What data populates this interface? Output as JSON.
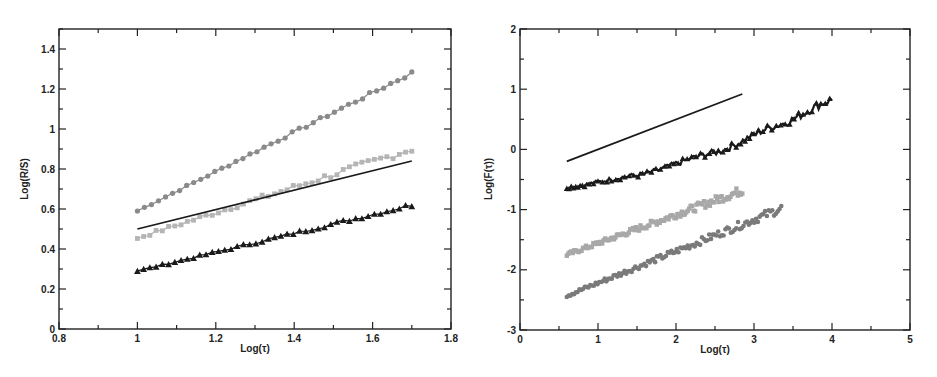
{
  "chart_data": [
    {
      "type": "line",
      "title": "",
      "xlabel": "Log(τ)",
      "ylabel": "Log(R/S)",
      "xlim": [
        0.8,
        1.8
      ],
      "ylim": [
        0,
        1.5
      ],
      "xticks": [
        0.8,
        1,
        1.2,
        1.4,
        1.6,
        1.8
      ],
      "xtick_labels": [
        "0.8",
        "1",
        "1.2",
        "1.4",
        "1.6",
        "1.8"
      ],
      "yticks": [
        0,
        0.2,
        0.4,
        0.6,
        0.8,
        1,
        1.2,
        1.4
      ],
      "ytick_labels": [
        "0",
        "0.2",
        "0.4",
        "0.6",
        "0.8",
        "1",
        "1.2",
        "1.4"
      ],
      "grid": false,
      "series": [
        {
          "name": "dark-gray-circles",
          "marker": "circle",
          "color": "#8a8a8a",
          "x": [
            1.0,
            1.7
          ],
          "y": [
            0.59,
            1.28
          ],
          "curve": "linear",
          "noise": 0.004
        },
        {
          "name": "light-gray-squares",
          "marker": "square",
          "color": "#b5b5b5",
          "x": [
            1.0,
            1.7
          ],
          "y": [
            0.455,
            0.9
          ],
          "curve": "linear",
          "noise": 0.008
        },
        {
          "name": "reference-line",
          "marker": "none",
          "color": "#1a1a1a",
          "x": [
            1.0,
            1.7
          ],
          "y": [
            0.5,
            0.84
          ]
        },
        {
          "name": "black-triangles",
          "marker": "triangle",
          "color": "#1a1a1a",
          "x": [
            1.0,
            1.7
          ],
          "y": [
            0.29,
            0.62
          ],
          "curve": "linear",
          "noise": 0.004
        }
      ]
    },
    {
      "type": "line",
      "title": "",
      "xlabel": "Log(τ)",
      "ylabel": "Log(F(τ))",
      "xlim": [
        0,
        5
      ],
      "ylim": [
        -3,
        2
      ],
      "xticks": [
        0,
        1,
        2,
        3,
        4,
        5
      ],
      "xtick_labels": [
        "0",
        "1",
        "2",
        "3",
        "4",
        "5"
      ],
      "yticks": [
        -3,
        -2,
        -1,
        0,
        1,
        2
      ],
      "ytick_labels": [
        "-3",
        "-2",
        "-1",
        "0",
        "1",
        "2"
      ],
      "grid": false,
      "series": [
        {
          "name": "reference-line",
          "marker": "none",
          "color": "#1a1a1a",
          "x": [
            0.6,
            2.85
          ],
          "y": [
            -0.2,
            0.92
          ]
        },
        {
          "name": "black-triangles",
          "marker": "triangle",
          "color": "#1a1a1a",
          "x": [
            0.6,
            1.5,
            2.5,
            3.3,
            4.0
          ],
          "y": [
            -0.63,
            -0.43,
            -0.05,
            0.4,
            0.82
          ],
          "curve": "smooth",
          "noise": 0.03
        },
        {
          "name": "light-gray-squares",
          "marker": "square",
          "color": "#a8a8a8",
          "x": [
            0.6,
            2.85
          ],
          "y": [
            -1.75,
            -0.68
          ],
          "curve": "linear",
          "noise": 0.03
        },
        {
          "name": "dark-gray-circles",
          "marker": "circle",
          "color": "#7a7a7a",
          "x": [
            0.6,
            3.35
          ],
          "y": [
            -2.43,
            -0.98
          ],
          "curve": "linear",
          "noise": 0.03
        }
      ]
    }
  ]
}
